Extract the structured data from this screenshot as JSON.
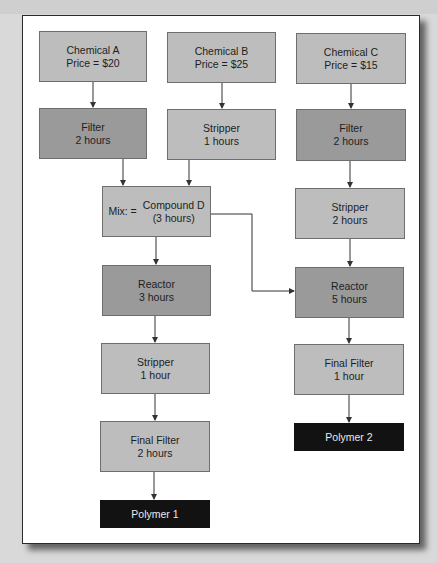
{
  "diagram": {
    "colors": {
      "light_box": "#bdbdbd",
      "dark_box": "#9a9a9a",
      "output_box": "#121212",
      "output_text": "#eaeaea",
      "arrow": "#333333"
    },
    "nodes": {
      "chem_a": {
        "line1": "Chemical A",
        "line2": "Price = $20"
      },
      "chem_b": {
        "line1": "Chemical B",
        "line2": "Price = $25"
      },
      "chem_c": {
        "line1": "Chemical C",
        "line2": "Price = $15"
      },
      "filter_a": {
        "line1": "Filter",
        "line2": "2 hours"
      },
      "stripper_b": {
        "line1": "Stripper",
        "line2": "1 hours"
      },
      "filter_c": {
        "line1": "Filter",
        "line2": "2 hours"
      },
      "mix_d": {
        "prefix": "Mix: =",
        "line1": "Compound D",
        "line2": "(3 hours)"
      },
      "stripper_c": {
        "line1": "Stripper",
        "line2": "2 hours"
      },
      "reactor_1": {
        "line1": "Reactor",
        "line2": "3 hours"
      },
      "reactor_2": {
        "line1": "Reactor",
        "line2": "5 hours"
      },
      "stripper_1": {
        "line1": "Stripper",
        "line2": "1 hour"
      },
      "final_filter_2": {
        "line1": "Final Filter",
        "line2": "1 hour"
      },
      "final_filter_1": {
        "line1": "Final Filter",
        "line2": "2 hours"
      },
      "polymer_2": {
        "label": "Polymer 2"
      },
      "polymer_1": {
        "label": "Polymer 1"
      }
    },
    "edges": [
      [
        "chem_a",
        "filter_a"
      ],
      [
        "chem_b",
        "stripper_b"
      ],
      [
        "chem_c",
        "filter_c"
      ],
      [
        "filter_a",
        "mix_d"
      ],
      [
        "stripper_b",
        "mix_d"
      ],
      [
        "filter_c",
        "stripper_c"
      ],
      [
        "mix_d",
        "reactor_1"
      ],
      [
        "mix_d",
        "reactor_2"
      ],
      [
        "stripper_c",
        "reactor_2"
      ],
      [
        "reactor_1",
        "stripper_1"
      ],
      [
        "reactor_2",
        "final_filter_2"
      ],
      [
        "stripper_1",
        "final_filter_1"
      ],
      [
        "final_filter_2",
        "polymer_2"
      ],
      [
        "final_filter_1",
        "polymer_1"
      ]
    ]
  }
}
